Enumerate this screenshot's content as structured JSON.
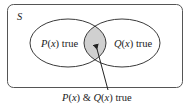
{
  "diagram": {
    "type": "venn",
    "universe_label": "S",
    "sets": [
      {
        "id": "P",
        "func": "P",
        "var": "x",
        "suffix": " true"
      },
      {
        "id": "Q",
        "func": "Q",
        "var": "x",
        "suffix": " true"
      }
    ],
    "intersection_label": {
      "p_func": "P",
      "q_func": "Q",
      "var": "x",
      "amp": " & ",
      "suffix": " true"
    },
    "colors": {
      "stroke": "#4a4a4a",
      "intersection_fill": "#d0d0d0",
      "background": "#ffffff",
      "text": "#222222"
    }
  }
}
